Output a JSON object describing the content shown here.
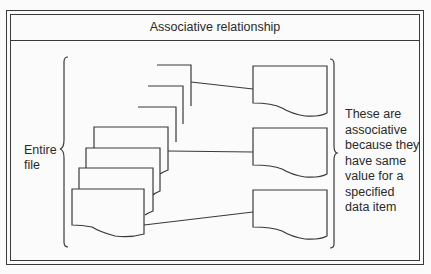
{
  "title": "Associative relationship",
  "left_label": {
    "lines": [
      "Entire",
      "file"
    ]
  },
  "right_label": {
    "lines": [
      "These are",
      "associative",
      "because they",
      "have same",
      "value for a",
      "specified",
      "data item"
    ]
  },
  "diagram": {
    "left_group": "Entire file (stack of record/document shapes)",
    "right_group": "Three associative records",
    "connections": 3,
    "stroke_color": "#3a3a3a",
    "background_color": "#fbfbfb"
  }
}
